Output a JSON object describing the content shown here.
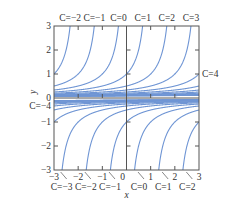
{
  "chart_data": {
    "type": "line",
    "title": "",
    "xlabel": "x",
    "ylabel": "y",
    "function": "y = 1/(C - x)",
    "xlim": [
      -3,
      3
    ],
    "ylim": [
      -3,
      3
    ],
    "x_ticks": [
      "-3",
      "-2",
      "-1",
      "0",
      "1",
      "2",
      "3"
    ],
    "y_ticks": [
      "-3",
      "-2",
      "-1",
      "0",
      "1",
      "2",
      "3"
    ],
    "grid": false,
    "curve_color": "#6f95d4",
    "axis_color": "#555555",
    "C_values": [
      -12,
      -11,
      -10,
      -9,
      -8,
      -7,
      -6,
      -5,
      -4,
      -3,
      -2,
      -1,
      0,
      1,
      2,
      3,
      4,
      5,
      6,
      7,
      8,
      9,
      10,
      11,
      12
    ],
    "top_labels": [
      "C = -2",
      "C = -1",
      "C = 0",
      "C = 1",
      "C = 2",
      "C = 3"
    ],
    "bottom_labels": [
      "C = -3",
      "C = -2",
      "C = -1",
      "C = 0",
      "C = 1",
      "C = 2"
    ],
    "side_labels": {
      "right": "C = 4",
      "left": "C = -4"
    }
  }
}
